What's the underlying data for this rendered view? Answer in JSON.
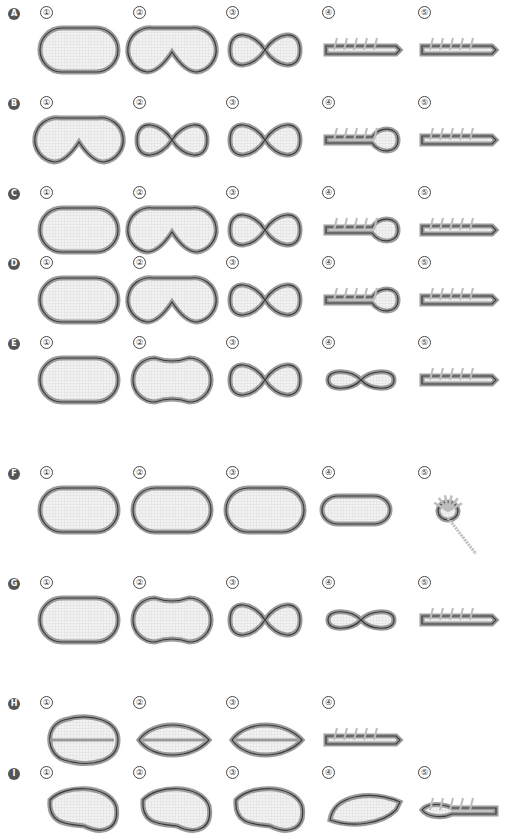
{
  "figure": {
    "colors": {
      "badge": "#555555",
      "ring_outer": "#9a9a9a",
      "ring_dark": "#3a3a3a",
      "mesh_fill": "#ececec",
      "halo": "#d6d6d6",
      "thread": "#bdbdbd",
      "suture_dark": "#333333"
    },
    "rows": [
      {
        "label": "A",
        "steps": [
          "①",
          "②",
          "③",
          "④",
          "⑤"
        ],
        "shapes": [
          "oval",
          "dented",
          "figure8",
          "strip",
          "strip"
        ]
      },
      {
        "label": "B",
        "steps": [
          "①",
          "②",
          "③",
          "④",
          "⑤"
        ],
        "shapes": [
          "dented",
          "figure8",
          "figure8",
          "loopstrip",
          "strip"
        ]
      },
      {
        "label": "C",
        "steps": [
          "①",
          "②",
          "③",
          "④",
          "⑤"
        ],
        "shapes": [
          "oval",
          "dented",
          "figure8",
          "loopstrip",
          "strip"
        ]
      },
      {
        "label": "D",
        "steps": [
          "①",
          "②",
          "③",
          "④",
          "⑤"
        ],
        "shapes": [
          "oval",
          "dented",
          "figure8",
          "loopstrip",
          "strip"
        ]
      },
      {
        "label": "E",
        "steps": [
          "①",
          "②",
          "③",
          "④",
          "⑤"
        ],
        "shapes": [
          "oval",
          "peanut",
          "figure8",
          "bow",
          "strip"
        ]
      },
      {
        "label": "F",
        "steps": [
          "①",
          "②",
          "③",
          "④",
          "⑤"
        ],
        "shapes": [
          "oval",
          "oval",
          "oval",
          "puck",
          "flower"
        ]
      },
      {
        "label": "G",
        "steps": [
          "①",
          "②",
          "③",
          "④",
          "⑤"
        ],
        "shapes": [
          "oval",
          "peanut",
          "figure8",
          "bow",
          "strip"
        ]
      },
      {
        "label": "H",
        "steps": [
          "①",
          "②",
          "③",
          "④"
        ],
        "shapes": [
          "egg",
          "lens",
          "lens",
          "strip"
        ]
      },
      {
        "label": "I",
        "steps": [
          "①",
          "②",
          "③",
          "④",
          "⑤"
        ],
        "shapes": [
          "bean",
          "bean",
          "bean",
          "wedge",
          "tailstrip"
        ]
      }
    ]
  }
}
